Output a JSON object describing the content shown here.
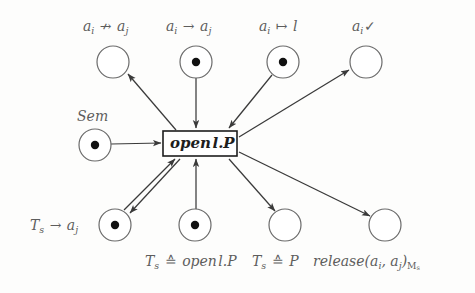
{
  "figure": {
    "type": "petri-net",
    "transition": {
      "label": "open l.P",
      "x": 163,
      "y": 131,
      "w": 74,
      "h": 25
    },
    "places": [
      {
        "id": "p-top-1",
        "label_html": "a<sub>i</sub> ↛ a<sub>j</sub>",
        "label_plain": "a_i ↛ a_j",
        "cx": 113,
        "cy": 62,
        "r": 16,
        "tokens": 0,
        "label_x": 83,
        "label_y": 20
      },
      {
        "id": "p-top-2",
        "label_html": "a<sub>i</sub> → a<sub>j</sub>",
        "label_plain": "a_i → a_j",
        "cx": 196,
        "cy": 62,
        "r": 16,
        "tokens": 1,
        "label_x": 166,
        "label_y": 20
      },
      {
        "id": "p-top-3",
        "label_html": "a<sub>i</sub> ↦ l",
        "label_plain": "a_i ↦ l",
        "cx": 283,
        "cy": 62,
        "r": 16,
        "tokens": 1,
        "label_x": 259,
        "label_y": 20
      },
      {
        "id": "p-top-4",
        "label_html": "a<sub>i</sub>✓",
        "label_plain": "a_i ✓",
        "cx": 366,
        "cy": 62,
        "r": 16,
        "tokens": 0,
        "label_x": 352,
        "label_y": 20
      },
      {
        "id": "p-sem",
        "label_html": "Sem",
        "label_plain": "Sem",
        "cx": 95,
        "cy": 145,
        "r": 16,
        "tokens": 1,
        "label_x": 77,
        "label_y": 110
      },
      {
        "id": "p-bot-1",
        "label_html": "T<sub>s</sub> → a<sub>j</sub>",
        "label_plain": "T_s → a_j",
        "cx": 115,
        "cy": 225,
        "r": 16,
        "tokens": 1,
        "label_x": 30,
        "label_y": 219
      },
      {
        "id": "p-bot-2",
        "label_html": "T<sub>s</sub> ≙ open l.P",
        "label_plain": "T_s ≙ open l.P",
        "cx": 195,
        "cy": 225,
        "r": 16,
        "tokens": 1,
        "label_x": 145,
        "label_y": 255
      },
      {
        "id": "p-bot-3",
        "label_html": "T<sub>s</sub> ≙ P",
        "label_plain": "T_s ≙ P",
        "cx": 285,
        "cy": 225,
        "r": 16,
        "tokens": 0,
        "label_x": 252,
        "label_y": 255
      },
      {
        "id": "p-bot-4",
        "label_html": "release(a<sub>i</sub>, a<sub>j</sub>)<sub>M<sub>s</sub></sub>",
        "label_plain": "release(a_i, a_j)_{M_s}",
        "cx": 385,
        "cy": 225,
        "r": 16,
        "tokens": 0,
        "label_x": 313,
        "label_y": 255
      }
    ],
    "arcs": [
      {
        "id": "arc-sem-to-t",
        "from": "p-sem",
        "to": "transition",
        "direction": "place-to-transition"
      },
      {
        "id": "arc-t-to-top1",
        "from": "transition",
        "to": "p-top-1",
        "direction": "transition-to-place"
      },
      {
        "id": "arc-top2-to-t",
        "from": "p-top-2",
        "to": "transition",
        "direction": "place-to-transition"
      },
      {
        "id": "arc-top3-to-t",
        "from": "p-top-3",
        "to": "transition",
        "direction": "place-to-transition"
      },
      {
        "id": "arc-t-to-top4",
        "from": "transition",
        "to": "p-top-4",
        "direction": "transition-to-place"
      },
      {
        "id": "arc-bot1-to-t",
        "from": "p-bot-1",
        "to": "transition",
        "direction": "place-to-transition"
      },
      {
        "id": "arc-t-to-bot1",
        "from": "transition",
        "to": "p-bot-1",
        "direction": "transition-to-place"
      },
      {
        "id": "arc-bot2-to-t",
        "from": "p-bot-2",
        "to": "transition",
        "direction": "place-to-transition"
      },
      {
        "id": "arc-t-to-bot3",
        "from": "transition",
        "to": "p-bot-3",
        "direction": "transition-to-place"
      },
      {
        "id": "arc-t-to-bot4",
        "from": "transition",
        "to": "p-bot-4",
        "direction": "transition-to-place"
      }
    ],
    "colors": {
      "stroke": "#3a3a3a",
      "place_stroke": "#6b6b6b",
      "token": "#111111",
      "label": "#5d5d5d",
      "transition_text": "#1d1d1d",
      "background": "#fdfdfc"
    }
  }
}
